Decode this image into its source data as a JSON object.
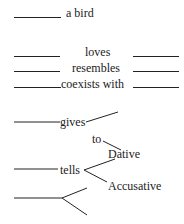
{
  "rows": {
    "bird": {
      "text": "a bird"
    },
    "loves": {
      "text": "loves"
    },
    "resembles": {
      "text": "resembles"
    },
    "coexists": {
      "text": "coexists with"
    }
  },
  "tree": {
    "gives": "gives",
    "to": "to",
    "dative": "Dative",
    "tells": "tells",
    "accusative": "Accusative"
  }
}
